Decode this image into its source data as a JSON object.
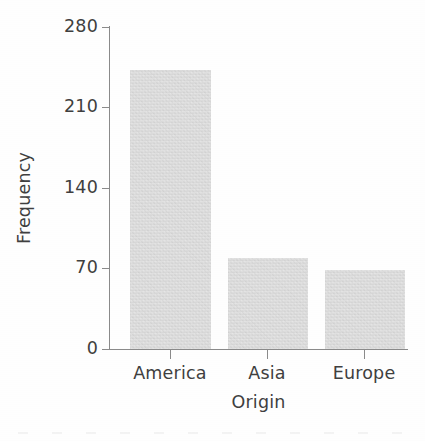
{
  "chart_data": {
    "type": "bar",
    "title": "",
    "subtitle": "",
    "xlabel": "Origin",
    "ylabel": "Frequency",
    "categories": [
      "America",
      "Asia",
      "Europe"
    ],
    "values": [
      243,
      79,
      69
    ],
    "series": [
      {
        "name": "Frequency",
        "values": [
          243,
          79,
          69
        ]
      }
    ],
    "ylim": [
      0,
      280
    ],
    "yticks": [
      0,
      70,
      140,
      210,
      280
    ],
    "ytick_labels": [
      "0",
      "70",
      "140",
      "210",
      "280"
    ],
    "xtick_labels": [
      "America",
      "Asia",
      "Europe"
    ],
    "grid": false,
    "legend": false,
    "legend_position": "none",
    "annotations": [],
    "colors": {
      "bar_fill": "#d7d7d7",
      "axis": "#8a8a8a",
      "text": "#3f3f3f",
      "background": "#fefefe"
    }
  }
}
